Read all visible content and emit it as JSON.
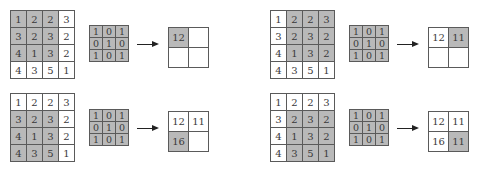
{
  "diagram": {
    "input": [
      [
        "1",
        "2",
        "2",
        "3"
      ],
      [
        "3",
        "2",
        "3",
        "2"
      ],
      [
        "4",
        "1",
        "3",
        "2"
      ],
      [
        "4",
        "3",
        "5",
        "1"
      ]
    ],
    "kernel": [
      [
        "1",
        "0",
        "1"
      ],
      [
        "0",
        "1",
        "0"
      ],
      [
        "1",
        "0",
        "1"
      ]
    ],
    "colors": {
      "highlight": "#b9b9b9",
      "grid_line": "#5a5a5a",
      "background": "#ffffff",
      "arrow": "#222222"
    },
    "steps": [
      {
        "name": "step-1",
        "window_row": 0,
        "window_col": 0,
        "output": [
          [
            "12",
            ""
          ],
          [
            "",
            ""
          ]
        ],
        "output_highlight": [
          0,
          0
        ]
      },
      {
        "name": "step-2",
        "window_row": 0,
        "window_col": 1,
        "output": [
          [
            "12",
            "11"
          ],
          [
            "",
            ""
          ]
        ],
        "output_highlight": [
          0,
          1
        ]
      },
      {
        "name": "step-3",
        "window_row": 1,
        "window_col": 0,
        "output": [
          [
            "12",
            "11"
          ],
          [
            "16",
            ""
          ]
        ],
        "output_highlight": [
          1,
          0
        ]
      },
      {
        "name": "step-4",
        "window_row": 1,
        "window_col": 1,
        "output": [
          [
            "12",
            "11"
          ],
          [
            "16",
            "11"
          ]
        ],
        "output_highlight": [
          1,
          1
        ]
      }
    ]
  }
}
